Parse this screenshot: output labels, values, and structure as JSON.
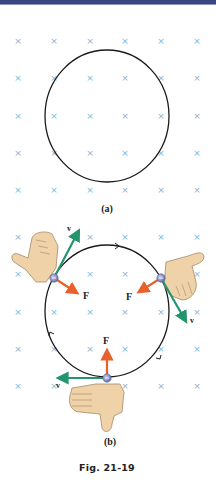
{
  "figure": {
    "caption": "Fig. 21-19",
    "colors": {
      "header_bar": "#3a4680",
      "field_marks": "#7fb3d9",
      "orbit": "#1a1a1a",
      "velocity": "#23946e",
      "force": "#e8612b",
      "particle": "#8a93c8",
      "hand_skin": "#efd2a8",
      "hand_outline": "#a58a68"
    },
    "panel_a": {
      "label": "(a)",
      "field_symbol": "×",
      "field_direction": "into page",
      "path": "circle"
    },
    "panel_b": {
      "label": "(b)",
      "field_symbol": "×",
      "particle_sign": "−",
      "positions": [
        {
          "name": "top-left",
          "velocity_label": "v",
          "force_label": "F"
        },
        {
          "name": "right",
          "velocity_label": "v",
          "force_label": "F"
        },
        {
          "name": "bottom",
          "velocity_label": "v",
          "force_label": "F"
        }
      ],
      "motion": "clockwise"
    }
  }
}
